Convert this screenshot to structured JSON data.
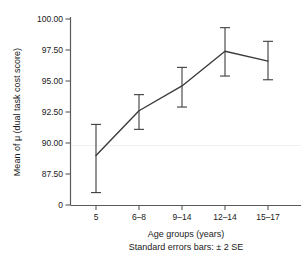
{
  "chart_data": {
    "type": "line",
    "title": "",
    "subtitle": "",
    "xlabel": "Age groups (years)",
    "ylabel": "Mean of μ (dual task cost score)",
    "caption": "Standard errors bars: ± 2 SE",
    "categories": [
      "5",
      "6–8",
      "9–14",
      "12–14",
      "15–17"
    ],
    "values": [
      89.0,
      92.6,
      94.6,
      97.4,
      96.6
    ],
    "error_upper": [
      91.5,
      93.9,
      96.1,
      99.3,
      98.2
    ],
    "error_lower": [
      86.0,
      91.1,
      92.9,
      95.4,
      95.1
    ],
    "error_type": "± 2 SE",
    "ylim": [
      86.0,
      100.0
    ],
    "yticks": [
      "100.00",
      "97.50",
      "95.00",
      "92.50",
      "90.00",
      "87.50",
      "0"
    ],
    "ytick_values": [
      100.0,
      97.5,
      95.0,
      92.5,
      90.0,
      87.5,
      0
    ],
    "grid": false,
    "legend": "none",
    "axis_broken_at_zero": true,
    "line_color": "#3c3c3c",
    "axis_color": "#5a5a5a",
    "text_color": "#1a1a1a",
    "background_color": "#ffffff"
  },
  "axis": {
    "y_title": "Mean of μ (dual task cost score)",
    "x_title": "Age groups (years)",
    "footnote": "Standard errors bars: ± 2 SE",
    "y_tick_labels": [
      "100.00",
      "97.50",
      "95.00",
      "92.50",
      "90.00",
      "87.50",
      "0"
    ],
    "x_tick_labels": [
      "5",
      "6–8",
      "9–14",
      "12–14",
      "15–17"
    ]
  }
}
